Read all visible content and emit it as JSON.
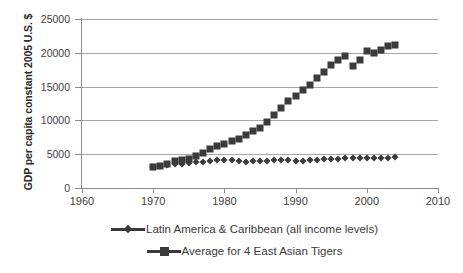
{
  "chart_data": {
    "type": "scatter",
    "title": "",
    "xlabel": "",
    "ylabel": "GDP per capita constant 2005 U.S. $",
    "xlim": [
      1960,
      2010
    ],
    "ylim": [
      0,
      25000
    ],
    "xticks": [
      1960,
      1970,
      1980,
      1990,
      2000,
      2010
    ],
    "yticks": [
      0,
      5000,
      10000,
      15000,
      20000,
      25000
    ],
    "grid": true,
    "legend_position": "bottom",
    "marker_color": "#3b3b3b",
    "series": [
      {
        "name": "Latin America & Caribbean (all income levels)",
        "marker": "diamond",
        "x": [
          1970,
          1971,
          1972,
          1973,
          1974,
          1975,
          1976,
          1977,
          1978,
          1979,
          1980,
          1981,
          1982,
          1983,
          1984,
          1985,
          1986,
          1987,
          1988,
          1989,
          1990,
          1991,
          1992,
          1993,
          1994,
          1995,
          1996,
          1997,
          1998,
          1999,
          2000,
          2001,
          2002,
          2003,
          2004
        ],
        "values": [
          3150,
          3250,
          3360,
          3500,
          3620,
          3680,
          3790,
          3880,
          3930,
          4080,
          4200,
          4160,
          4010,
          3880,
          3930,
          3990,
          4050,
          4100,
          4070,
          4070,
          4000,
          4050,
          4090,
          4150,
          4240,
          4250,
          4330,
          4440,
          4440,
          4390,
          4500,
          4450,
          4380,
          4420,
          4630
        ]
      },
      {
        "name": "Average for 4 East Asian Tigers",
        "marker": "square",
        "x": [
          1970,
          1971,
          1972,
          1973,
          1974,
          1975,
          1976,
          1977,
          1978,
          1979,
          1980,
          1981,
          1982,
          1983,
          1984,
          1985,
          1986,
          1987,
          1988,
          1989,
          1990,
          1991,
          1992,
          1993,
          1994,
          1995,
          1996,
          1997,
          1998,
          1999,
          2000,
          2001,
          2002,
          2003,
          2004
        ],
        "values": [
          3100,
          3300,
          3600,
          4000,
          4150,
          4350,
          4800,
          5200,
          5700,
          6150,
          6500,
          6950,
          7200,
          7800,
          8500,
          8900,
          9700,
          10800,
          11900,
          12800,
          13600,
          14500,
          15300,
          16200,
          17200,
          18200,
          19000,
          19500,
          18100,
          19000,
          20300,
          19900,
          20400,
          21000,
          21200
        ]
      }
    ]
  },
  "legend": {
    "items": [
      {
        "label": "Latin America & Caribbean (all income levels)",
        "marker": "diamond"
      },
      {
        "label": "Average for 4 East Asian Tigers",
        "marker": "square"
      }
    ]
  }
}
